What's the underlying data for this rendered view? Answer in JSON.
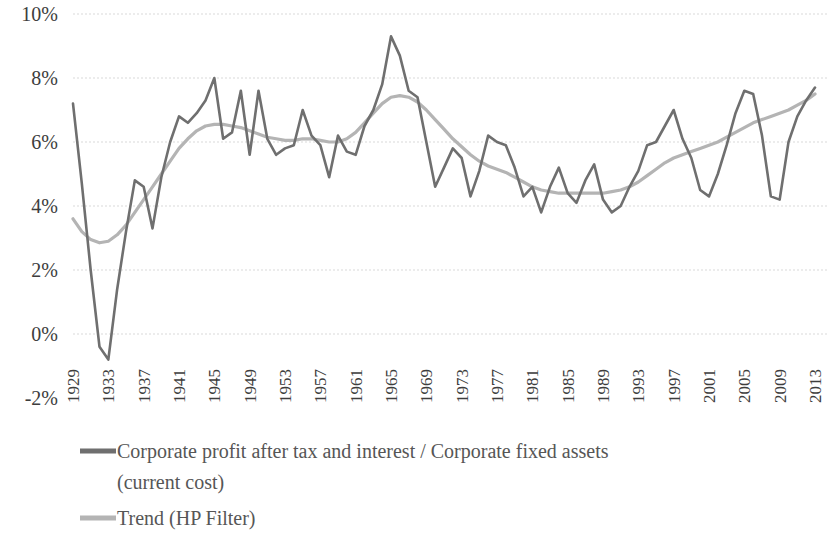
{
  "chart_data": {
    "type": "line",
    "title": "",
    "subtitle": "",
    "xlabel": "",
    "ylabel": "",
    "grid": true,
    "legend_position": "bottom-left",
    "ylim": [
      -2,
      10
    ],
    "y_ticks": [
      "10%",
      "8%",
      "6%",
      "4%",
      "2%",
      "0%",
      "-2%"
    ],
    "y_tick_values": [
      10,
      8,
      6,
      4,
      2,
      0,
      -2
    ],
    "xlim": [
      1929,
      2013
    ],
    "x_ticks": [
      "1929",
      "1933",
      "1937",
      "1941",
      "1945",
      "1949",
      "1953",
      "1957",
      "1961",
      "1965",
      "1969",
      "1973",
      "1977",
      "1981",
      "1985",
      "1989",
      "1993",
      "1997",
      "2001",
      "2005",
      "2009",
      "2013"
    ],
    "x_tick_values": [
      1929,
      1933,
      1937,
      1941,
      1945,
      1949,
      1953,
      1957,
      1961,
      1965,
      1969,
      1973,
      1977,
      1981,
      1985,
      1989,
      1993,
      1997,
      2001,
      2005,
      2009,
      2013
    ],
    "x": [
      1929,
      1930,
      1931,
      1932,
      1933,
      1934,
      1935,
      1936,
      1937,
      1938,
      1939,
      1940,
      1941,
      1942,
      1943,
      1944,
      1945,
      1946,
      1947,
      1948,
      1949,
      1950,
      1951,
      1952,
      1953,
      1954,
      1955,
      1956,
      1957,
      1958,
      1959,
      1960,
      1961,
      1962,
      1963,
      1964,
      1965,
      1966,
      1967,
      1968,
      1969,
      1970,
      1971,
      1972,
      1973,
      1974,
      1975,
      1976,
      1977,
      1978,
      1979,
      1980,
      1981,
      1982,
      1983,
      1984,
      1985,
      1986,
      1987,
      1988,
      1989,
      1990,
      1991,
      1992,
      1993,
      1994,
      1995,
      1996,
      1997,
      1998,
      1999,
      2000,
      2001,
      2002,
      2003,
      2004,
      2005,
      2006,
      2007,
      2008,
      2009,
      2010,
      2011,
      2012,
      2013
    ],
    "series": [
      {
        "name": "Corporate profit after tax and interest / Corporate fixed assets (current cost)",
        "color": "#6f6f6f",
        "values": [
          7.2,
          4.7,
          2.0,
          -0.4,
          -0.8,
          1.4,
          3.2,
          4.8,
          4.6,
          3.3,
          4.9,
          6.0,
          6.8,
          6.6,
          6.9,
          7.3,
          8.0,
          6.1,
          6.3,
          7.6,
          5.6,
          7.6,
          6.1,
          5.6,
          5.8,
          5.9,
          7.0,
          6.2,
          5.9,
          4.9,
          6.2,
          5.7,
          5.6,
          6.5,
          7.0,
          7.8,
          9.3,
          8.7,
          7.6,
          7.4,
          6.0,
          4.6,
          5.2,
          5.8,
          5.5,
          4.3,
          5.1,
          6.2,
          6.0,
          5.9,
          5.2,
          4.3,
          4.6,
          3.8,
          4.6,
          5.2,
          4.4,
          4.1,
          4.8,
          5.3,
          4.2,
          3.8,
          4.0,
          4.6,
          5.1,
          5.9,
          6.0,
          6.5,
          7.0,
          6.1,
          5.5,
          4.5,
          4.3,
          5.0,
          5.9,
          6.9,
          7.6,
          7.5,
          6.2,
          4.3,
          4.2,
          6.0,
          6.8,
          7.3,
          7.7
        ]
      },
      {
        "name": "Trend (HP Filter)",
        "color": "#b4b4b4",
        "values": [
          3.6,
          3.2,
          2.95,
          2.85,
          2.9,
          3.1,
          3.4,
          3.8,
          4.2,
          4.6,
          5.0,
          5.4,
          5.8,
          6.1,
          6.35,
          6.5,
          6.55,
          6.55,
          6.5,
          6.45,
          6.35,
          6.25,
          6.15,
          6.1,
          6.05,
          6.05,
          6.1,
          6.1,
          6.05,
          6.0,
          6.0,
          6.1,
          6.3,
          6.6,
          6.9,
          7.2,
          7.4,
          7.45,
          7.4,
          7.25,
          7.0,
          6.7,
          6.4,
          6.1,
          5.85,
          5.6,
          5.4,
          5.25,
          5.15,
          5.05,
          4.9,
          4.75,
          4.6,
          4.5,
          4.45,
          4.4,
          4.4,
          4.4,
          4.4,
          4.4,
          4.4,
          4.45,
          4.5,
          4.6,
          4.75,
          4.95,
          5.15,
          5.35,
          5.5,
          5.6,
          5.7,
          5.8,
          5.9,
          6.0,
          6.15,
          6.3,
          6.45,
          6.6,
          6.7,
          6.8,
          6.9,
          7.0,
          7.15,
          7.3,
          7.5
        ]
      }
    ]
  },
  "legend": {
    "items": [
      {
        "label": "Corporate profit after tax and interest / Corporate fixed assets",
        "label_line2": "(current cost)",
        "color": "#6f6f6f"
      },
      {
        "label": "Trend (HP Filter)",
        "label_line2": "",
        "color": "#b4b4b4"
      }
    ]
  }
}
